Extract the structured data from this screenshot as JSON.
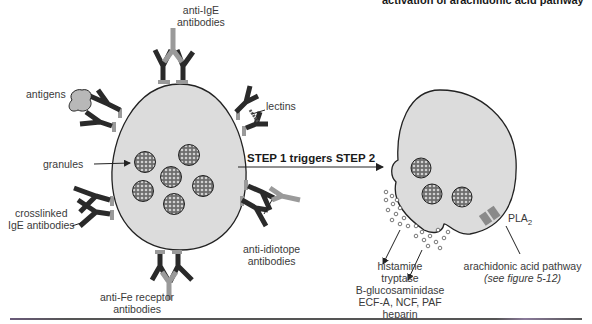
{
  "header": {
    "partial_title": "activation of arachidonic acid pathway"
  },
  "left_cell": {
    "labels": {
      "anti_ige": [
        "anti-IgE",
        "antibodies"
      ],
      "antigens": "antigens",
      "lectins": "lectins",
      "granules": "granules",
      "crosslinked": [
        "crosslinked",
        "IgE antibodies"
      ],
      "anti_idiotope": [
        "anti-idiotope",
        "antibodies"
      ],
      "anti_fc": [
        "anti-Fe receptor",
        "antibodies"
      ]
    }
  },
  "arrow": {
    "label": "STEP 1 triggers STEP 2"
  },
  "right_cell": {
    "enzyme": {
      "name": "PLA",
      "subscript": "2"
    },
    "mediators": [
      "histamine",
      "tryptase",
      "B-glucosaminidase",
      "ECF-A, NCF, PAF",
      "heparin"
    ],
    "pathway": {
      "label": "arachidonic acid pathway",
      "reference": "(see figure 5-12)"
    }
  },
  "colors": {
    "cell_fill": "#dcdcdc",
    "antibody_dark": "#2a2a2a",
    "antibody_light": "#9a9a9a",
    "outline": "#222222"
  }
}
